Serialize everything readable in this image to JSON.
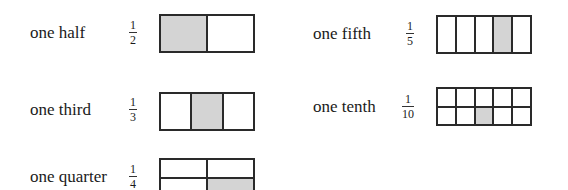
{
  "colors": {
    "shaded": "#d4d4d4",
    "line": "#2a2a2a",
    "background": "#ffffff"
  },
  "fractions": [
    {
      "id": "half",
      "label": "one half",
      "numerator": "1",
      "denominator": "2",
      "rows": 1,
      "cols": 2,
      "shaded": [
        [
          0,
          0
        ]
      ]
    },
    {
      "id": "third",
      "label": "one third",
      "numerator": "1",
      "denominator": "3",
      "rows": 1,
      "cols": 3,
      "shaded": [
        [
          0,
          1
        ]
      ]
    },
    {
      "id": "quarter",
      "label": "one quarter",
      "numerator": "1",
      "denominator": "4",
      "rows": 2,
      "cols": 2,
      "shaded": [
        [
          1,
          1
        ]
      ]
    },
    {
      "id": "fifth",
      "label": "one fifth",
      "numerator": "1",
      "denominator": "5",
      "rows": 1,
      "cols": 5,
      "shaded": [
        [
          0,
          3
        ]
      ]
    },
    {
      "id": "tenth",
      "label": "one tenth",
      "numerator": "1",
      "denominator": "10",
      "rows": 2,
      "cols": 5,
      "shaded": [
        [
          1,
          2
        ]
      ]
    }
  ]
}
